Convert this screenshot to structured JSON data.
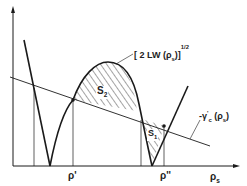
{
  "figure": {
    "type": "phase-construction-diagram",
    "x_axis": {
      "label": "ρs",
      "label_main": "ρ",
      "label_sub": "s"
    },
    "ticks": [
      {
        "id": "rho-prime",
        "label": "ρ'"
      },
      {
        "id": "rho-double-prime",
        "label": "ρ''"
      }
    ],
    "curves": {
      "arch": {
        "label_prefix": "[ 2 LW (",
        "label_var": "ρ",
        "label_sub": "s",
        "label_suffix": ")]",
        "label_exp": "1/2"
      },
      "line": {
        "label_prefix": "-γ",
        "label_sup": "'",
        "label_sub2": "c",
        "label_suffix_open": " (",
        "label_var": "ρ",
        "label_sub": "s",
        "label_suffix_close": ")"
      }
    },
    "areas": [
      {
        "id": "S2",
        "label_main": "S",
        "label_sub": "2"
      },
      {
        "id": "S1",
        "label_main": "S",
        "label_sub": "1"
      }
    ],
    "colors": {
      "ink": "#1a1a1a",
      "background": "#ffffff"
    }
  }
}
